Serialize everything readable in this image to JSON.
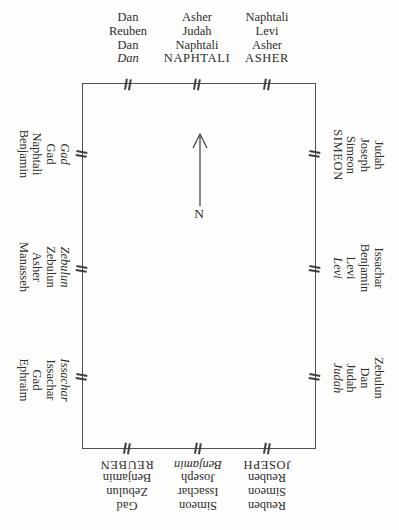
{
  "compass": {
    "label": "N",
    "arrow_direction": "up"
  },
  "colors": {
    "ink": "#2d2d2d",
    "wall_border": "#4f4f4f",
    "background": "#fdfdfc"
  },
  "walls": {
    "top": [
      [
        "Dan",
        "Reuben",
        "Dan",
        "Dan"
      ],
      [
        "Asher",
        "Judah",
        "Naphtali",
        "NAPHTALI"
      ],
      [
        "Naphtali",
        "Levi",
        "Asher",
        "ASHER"
      ]
    ],
    "right": [
      [
        "Judah",
        "Joseph",
        "Simeon",
        "SIMEON"
      ],
      [
        "Issachar",
        "Benjamin",
        "Levi",
        "Levi"
      ],
      [
        "Zebulun",
        "Dan",
        "Judah",
        "Judah"
      ]
    ],
    "bottom": [
      [
        "Gad",
        "Zebulun",
        "Benjamin",
        "REUBEN"
      ],
      [
        "Simeon",
        "Issachar",
        "Joseph",
        "Benjamin"
      ],
      [
        "Reuben",
        "Simeon",
        "Reuben",
        "JOSEPH"
      ]
    ],
    "left": [
      [
        "Benjamin",
        "Naphtali",
        "Gad",
        "Gad"
      ],
      [
        "Manasseh",
        "Asher",
        "Zebulun",
        "Zebulun"
      ],
      [
        "Ephraim",
        "Gad",
        "Issachar",
        "Issachar"
      ]
    ]
  }
}
